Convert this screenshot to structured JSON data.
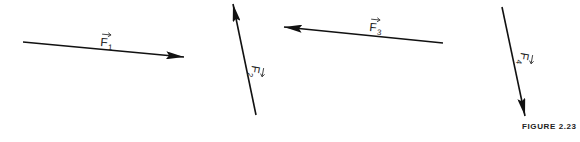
{
  "figure": {
    "caption": "FIGURE 2.23",
    "vectors": [
      {
        "id": "F1",
        "label": "F",
        "subscript": "1",
        "direction": "right, slightly downward"
      },
      {
        "id": "F2",
        "label": "F",
        "subscript": "2",
        "direction": "up, slightly leftward"
      },
      {
        "id": "F3",
        "label": "F",
        "subscript": "3",
        "direction": "left, slightly upward"
      },
      {
        "id": "F4",
        "label": "F",
        "subscript": "4",
        "direction": "down, slightly rightward"
      }
    ],
    "colors": {
      "stroke": "#111111",
      "text": "#222222",
      "background": "#ffffff"
    }
  }
}
